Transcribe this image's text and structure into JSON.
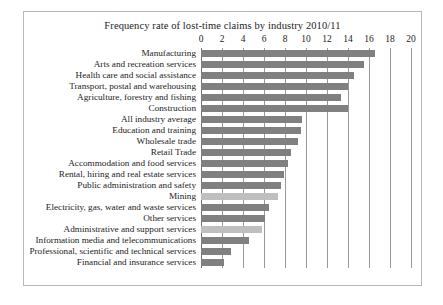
{
  "chart_data": {
    "type": "bar",
    "orientation": "horizontal",
    "title": "Frequency rate of lost-time claims by industry 2010/11",
    "xlabel": "",
    "ylabel": "",
    "xlim": [
      0,
      20
    ],
    "xticks": [
      0,
      2,
      4,
      6,
      8,
      10,
      12,
      14,
      16,
      18,
      20
    ],
    "grid": true,
    "legend": "none",
    "bar_color": "#808080",
    "highlight_color": "#bfbfbf",
    "categories": [
      "Manufacturing",
      "Arts and recreation services",
      "Health care and social assistance",
      "Transport, postal and warehousing",
      "Agriculture, forestry and fishing",
      "Construction",
      "All industry average",
      "Education and training",
      "Wholesale trade",
      "Retail Trade",
      "Accommodation and food services",
      "Rental, hiring and real estate services",
      "Public administration and safety",
      "Mining",
      "Electricity, gas, water and waste services",
      "Other services",
      "Administrative and support services",
      "Information media and telecommunications",
      "Professional, scientific and technical services",
      "Financial and insurance services"
    ],
    "values": [
      16.6,
      15.5,
      14.6,
      14.0,
      13.3,
      14.0,
      9.6,
      9.5,
      9.2,
      8.6,
      8.3,
      7.9,
      7.6,
      7.3,
      6.5,
      6.1,
      5.8,
      4.6,
      2.9,
      2.2
    ]
  }
}
